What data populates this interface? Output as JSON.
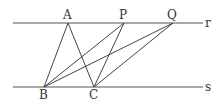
{
  "diagram": {
    "lines": [
      {
        "name": "r",
        "label": "r",
        "y": 23,
        "x1": 13,
        "x2": 203
      },
      {
        "name": "s",
        "label": "s",
        "y": 87,
        "x1": 13,
        "x2": 203
      }
    ],
    "points": {
      "A": {
        "label": "A",
        "x": 68,
        "y": 23
      },
      "P": {
        "label": "P",
        "x": 124,
        "y": 23
      },
      "Q": {
        "label": "Q",
        "x": 173,
        "y": 23
      },
      "B": {
        "label": "B",
        "x": 44,
        "y": 87
      },
      "C": {
        "label": "C",
        "x": 94,
        "y": 87
      }
    },
    "segments": [
      [
        "A",
        "B"
      ],
      [
        "A",
        "C"
      ],
      [
        "P",
        "B"
      ],
      [
        "P",
        "C"
      ],
      [
        "Q",
        "B"
      ],
      [
        "Q",
        "C"
      ]
    ],
    "colors": {
      "stroke": "#444444",
      "text": "#333333",
      "background": "#ffffff"
    }
  }
}
